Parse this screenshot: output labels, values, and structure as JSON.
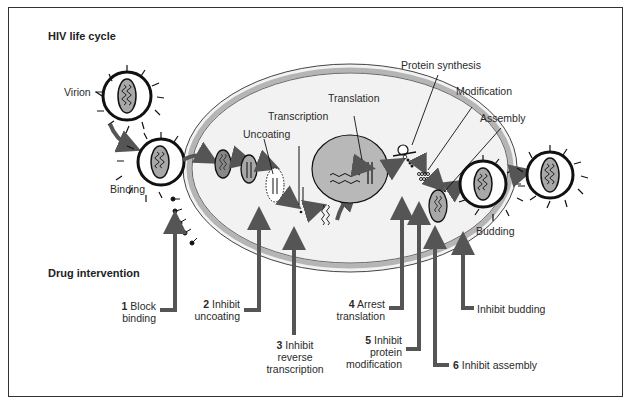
{
  "title": "HIV life cycle",
  "drug_heading": "Drug intervention",
  "colors": {
    "arrow": "#555555",
    "cell_fill": "#f2f2f2",
    "membrane": "#b5b5b5",
    "nucleus": "#b8b8b8",
    "virion_outline": "#111111",
    "capsid": "#a8a8a8"
  },
  "stages": {
    "virion": "Virion",
    "binding": "Binding",
    "uncoating": "Uncoating",
    "transcription": "Transcription",
    "translation": "Translation",
    "protein_synthesis": "Protein synthesis",
    "modification": "Modification",
    "assembly": "Assembly",
    "budding": "Budding"
  },
  "interventions": [
    {
      "num": "1",
      "line1": "Block",
      "line2": "binding",
      "line3": ""
    },
    {
      "num": "2",
      "line1": "Inhibit",
      "line2": "uncoating",
      "line3": ""
    },
    {
      "num": "3",
      "line1": "Inhibit",
      "line2": "reverse",
      "line3": "transcription"
    },
    {
      "num": "4",
      "line1": "Arrest",
      "line2": "translation",
      "line3": ""
    },
    {
      "num": "5",
      "line1": "Inhibit",
      "line2": "protein",
      "line3": "modification"
    },
    {
      "num": "6",
      "line1": "Inhibit assembly",
      "line2": "",
      "line3": ""
    },
    {
      "num": "",
      "line1": "Inhibit budding",
      "line2": "",
      "line3": ""
    }
  ]
}
